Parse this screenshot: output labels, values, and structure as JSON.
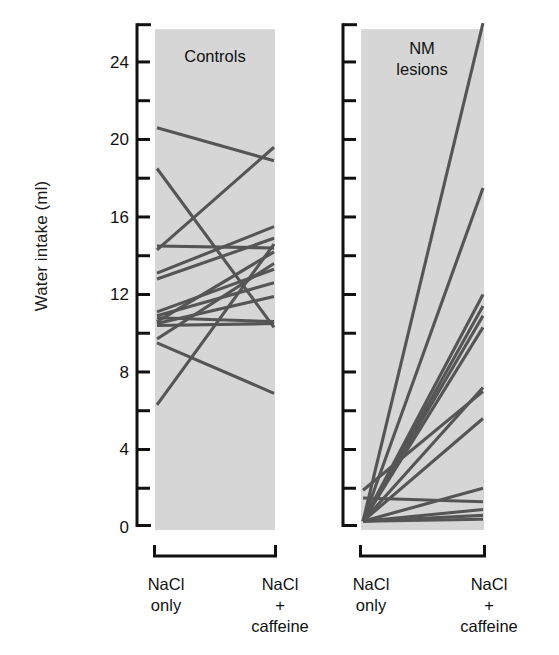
{
  "figure": {
    "y_axis_label": "Water intake (ml)",
    "y_ticks_major": [
      "0",
      "4",
      "8",
      "12",
      "16",
      "20",
      "24"
    ],
    "y_major_values": [
      0,
      4,
      8,
      12,
      16,
      20,
      24
    ],
    "y_minor_values": [
      2,
      6,
      10,
      14,
      18,
      22,
      26
    ],
    "panels": [
      {
        "id": "controls",
        "title": "Controls",
        "title_lines": [
          "Controls"
        ],
        "x_left_label": [
          "NaCl",
          "only"
        ],
        "x_right_label": [
          "NaCl",
          "+",
          "caffeine"
        ]
      },
      {
        "id": "nm-lesions",
        "title": "NM lesions",
        "title_lines": [
          "NM",
          "lesions"
        ],
        "x_left_label": [
          "NaCl",
          "only"
        ],
        "x_right_label": [
          "NaCl",
          "+",
          "caffeine"
        ]
      }
    ],
    "colors": {
      "panel_fill": "#d6d6d6",
      "line": "#555555",
      "axis": "#111111",
      "background": "#ffffff"
    }
  },
  "chart_data": {
    "type": "line",
    "title": "",
    "subtitle": "",
    "xlabel": "",
    "ylabel": "Water intake (ml)",
    "ylim": [
      0,
      26
    ],
    "grid": false,
    "legend": null,
    "categories": [
      "NaCl only",
      "NaCl + caffeine"
    ],
    "panels": [
      {
        "name": "Controls",
        "x_categories": [
          "NaCl only",
          "NaCl + caffeine"
        ],
        "series": [
          {
            "name": "c1",
            "values": [
              20.6,
              18.9
            ]
          },
          {
            "name": "c2",
            "values": [
              18.5,
              10.3
            ]
          },
          {
            "name": "c3",
            "values": [
              14.5,
              14.4
            ]
          },
          {
            "name": "c4",
            "values": [
              14.3,
              19.6
            ]
          },
          {
            "name": "c5",
            "values": [
              13.1,
              15.5
            ]
          },
          {
            "name": "c6",
            "values": [
              12.8,
              14.9
            ]
          },
          {
            "name": "c7",
            "values": [
              11.1,
              13.3
            ]
          },
          {
            "name": "c8",
            "values": [
              10.9,
              12.6
            ]
          },
          {
            "name": "c9",
            "values": [
              10.8,
              10.6
            ]
          },
          {
            "name": "c10",
            "values": [
              10.6,
              14.2
            ]
          },
          {
            "name": "c11",
            "values": [
              10.5,
              11.9
            ]
          },
          {
            "name": "c12",
            "values": [
              10.4,
              10.5
            ]
          },
          {
            "name": "c13",
            "values": [
              9.7,
              13.6
            ]
          },
          {
            "name": "c14",
            "values": [
              9.5,
              6.9
            ]
          },
          {
            "name": "c15",
            "values": [
              6.3,
              14.6
            ]
          }
        ]
      },
      {
        "name": "NM lesions",
        "x_categories": [
          "NaCl only",
          "NaCl + caffeine"
        ],
        "series": [
          {
            "name": "n1",
            "values": [
              0.3,
              26.0
            ]
          },
          {
            "name": "n2",
            "values": [
              0.3,
              17.5
            ]
          },
          {
            "name": "n3",
            "values": [
              0.3,
              12.0
            ]
          },
          {
            "name": "n4",
            "values": [
              0.3,
              11.4
            ]
          },
          {
            "name": "n5",
            "values": [
              0.3,
              10.9
            ]
          },
          {
            "name": "n6",
            "values": [
              0.3,
              10.3
            ]
          },
          {
            "name": "n7",
            "values": [
              0.3,
              7.2
            ]
          },
          {
            "name": "n8",
            "values": [
              0.3,
              5.6
            ]
          },
          {
            "name": "n9",
            "values": [
              1.9,
              7.0
            ]
          },
          {
            "name": "n10",
            "values": [
              0.3,
              2.0
            ]
          },
          {
            "name": "n11",
            "values": [
              1.5,
              1.3
            ]
          },
          {
            "name": "n12",
            "values": [
              0.3,
              0.9
            ]
          },
          {
            "name": "n13",
            "values": [
              0.3,
              0.6
            ]
          },
          {
            "name": "n14",
            "values": [
              0.3,
              0.4
            ]
          }
        ]
      }
    ]
  }
}
